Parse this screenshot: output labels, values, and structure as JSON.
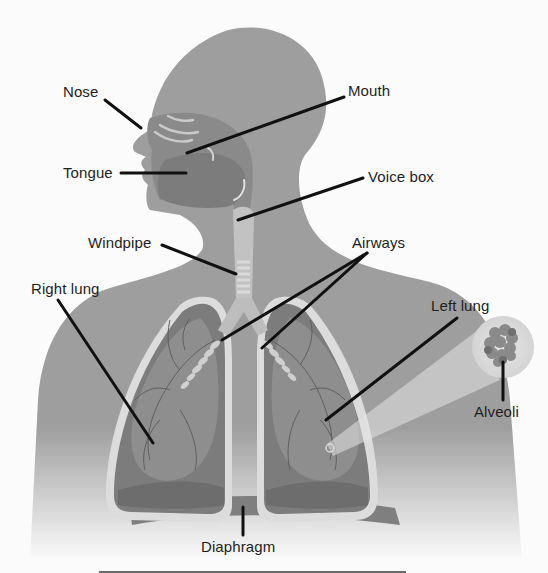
{
  "diagram": {
    "colors": {
      "background": "#fbfbfb",
      "body": "#9e9e9e",
      "body_dark": "#8c8c8c",
      "lung_outline": "#d9d9d9",
      "lung_fill": "#7a7a7a",
      "lung_inner": "#8f8f8f",
      "airway": "#c4c4c4",
      "leader_line": "#111111",
      "label_text": "#1e1e1e"
    },
    "labels": {
      "nose": "Nose",
      "mouth": "Mouth",
      "tongue": "Tongue",
      "voice_box": "Voice box",
      "windpipe": "Windpipe",
      "airways": "Airways",
      "right_lung": "Right lung",
      "left_lung": "Left lung",
      "alveoli": "Alveoli",
      "diaphragm": "Diaphragm"
    }
  }
}
